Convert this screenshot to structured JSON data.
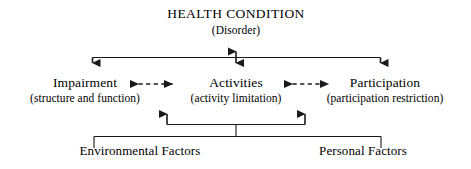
{
  "diagram": {
    "title": "HEALTH CONDITION",
    "background_color": "#ffffff",
    "line_color": "#1a1a1a",
    "health_condition": {
      "title": "HEALTH CONDITION",
      "subtitle": "(Disorder)"
    },
    "components": [
      {
        "key": "impairment",
        "title": "Impairment",
        "subtitle": "(structure and function)"
      },
      {
        "key": "activities",
        "title": "Activities",
        "subtitle": "(activity limitation)"
      },
      {
        "key": "participation",
        "title": "Participation",
        "subtitle": "(participation restriction)"
      }
    ],
    "contextual_factors": [
      {
        "key": "environmental",
        "label": "Environmental Factors"
      },
      {
        "key": "personal",
        "label": "Personal Factors"
      }
    ],
    "connectors": [
      {
        "name": "health-to-impairment",
        "style": "solid",
        "heads": "single-down"
      },
      {
        "name": "health-to-activities",
        "style": "solid",
        "heads": "double-vertical"
      },
      {
        "name": "health-to-participation",
        "style": "solid",
        "heads": "single-down"
      },
      {
        "name": "impairment-activities",
        "style": "dashed",
        "heads": "double-horizontal"
      },
      {
        "name": "activities-participation",
        "style": "dashed",
        "heads": "double-horizontal"
      },
      {
        "name": "factors-to-components",
        "style": "solid",
        "heads": "double-up"
      }
    ]
  }
}
